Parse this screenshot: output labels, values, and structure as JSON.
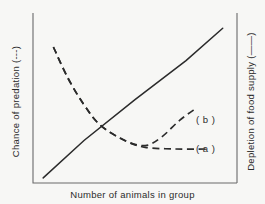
{
  "chart_data": {
    "type": "line",
    "title": "",
    "xlabel": "Number of animals in group",
    "ylabel_left": "Chance of predation (---)",
    "ylabel_right": "Depletion of food supply (——)",
    "grid": false,
    "legend_position": "inline-right",
    "axes": {
      "x_ticks": [],
      "y_ticks_left": [],
      "y_ticks_right": [],
      "xlim": [
        0,
        1
      ],
      "ylim": [
        0,
        1
      ],
      "note": "Schematic diagram — axes are unlabelled and unscaled"
    },
    "series": [
      {
        "name": "Depletion of food supply",
        "style": "solid",
        "label": "",
        "axis": "right",
        "points": [
          [
            0.05,
            0.03
          ],
          [
            0.25,
            0.25
          ],
          [
            0.5,
            0.49
          ],
          [
            0.75,
            0.72
          ],
          [
            0.93,
            0.91
          ]
        ]
      },
      {
        "name": "Chance of predation (a)",
        "style": "dashed",
        "label": "( a )",
        "axis": "left",
        "points": [
          [
            0.1,
            0.8
          ],
          [
            0.17,
            0.62
          ],
          [
            0.25,
            0.46
          ],
          [
            0.33,
            0.34
          ],
          [
            0.45,
            0.25
          ],
          [
            0.55,
            0.21
          ],
          [
            0.7,
            0.2
          ],
          [
            0.85,
            0.2
          ]
        ]
      },
      {
        "name": "Chance of predation (b)",
        "style": "dashed",
        "label": "( b )",
        "axis": "left",
        "points": [
          [
            0.1,
            0.8
          ],
          [
            0.17,
            0.62
          ],
          [
            0.25,
            0.46
          ],
          [
            0.33,
            0.34
          ],
          [
            0.45,
            0.25
          ],
          [
            0.55,
            0.22
          ],
          [
            0.63,
            0.27
          ],
          [
            0.72,
            0.37
          ],
          [
            0.8,
            0.44
          ]
        ]
      }
    ],
    "annotations": [
      {
        "text": "( b )",
        "x": 0.86,
        "y": 0.44
      },
      {
        "text": "( a )",
        "x": 0.86,
        "y": 0.2
      }
    ],
    "colors": {
      "line": "#2b2b2b",
      "axis": "#6a6a6a",
      "text": "#2b2b2b",
      "background": "#f7f7f5"
    }
  }
}
